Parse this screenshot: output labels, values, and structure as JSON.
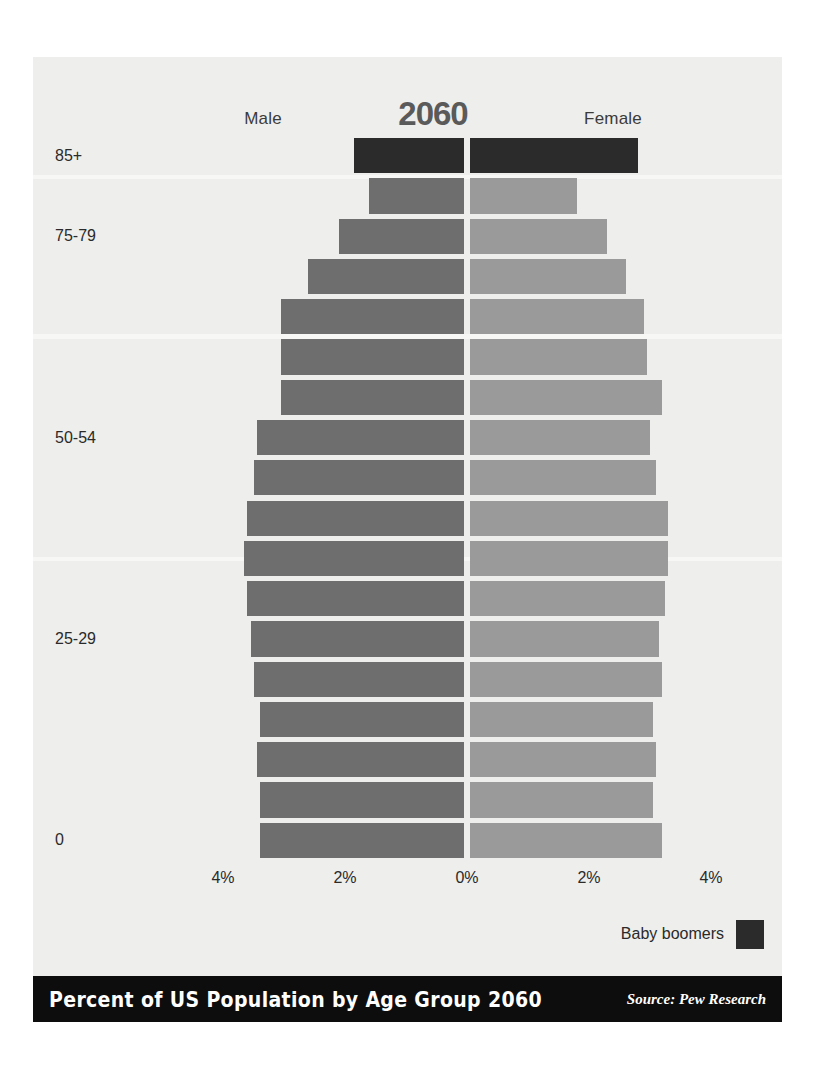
{
  "poster": {
    "background_color": "#eeeeec",
    "footer_bg_color": "#0d0d0d",
    "footer_text_color": "#ffffff"
  },
  "header": {
    "year": "2060",
    "male_label": "Male",
    "female_label": "Female"
  },
  "legend": {
    "label": "Baby boomers",
    "color": "#2b2b2b"
  },
  "footer": {
    "title": "Percent of US Population by Age Group 2060",
    "source": "Source: Pew Research"
  },
  "chart_data": {
    "type": "bar",
    "subtype": "population-pyramid",
    "title": "Percent of US Population by Age Group 2060",
    "year": "2060",
    "xlabel": "",
    "ylabel": "",
    "xlim": [
      -4,
      4
    ],
    "xticks": [
      -4,
      -2,
      0,
      2,
      4
    ],
    "xtick_labels": [
      "4%",
      "2%",
      "0%",
      "2%",
      "4%"
    ],
    "grid": false,
    "legend_position": "bottom-right",
    "center_pixel": 434,
    "pixels_per_percent": 61,
    "colors": {
      "male": "#6e6e6e",
      "female": "#9a9a9a",
      "baby_boomer": "#2b2b2b"
    },
    "categories": [
      "85+",
      "80-84",
      "75-79",
      "70-74",
      "65-69",
      "60-64",
      "55-59",
      "50-54",
      "45-49",
      "40-44",
      "35-39",
      "30-34",
      "25-29",
      "20-24",
      "15-19",
      "10-14",
      "5-9",
      "0"
    ],
    "visible_tick_labels": [
      "85+",
      "75-79",
      "50-54",
      "25-29",
      "0"
    ],
    "visible_tick_indices": [
      0,
      2,
      7,
      12,
      17
    ],
    "series": [
      {
        "name": "Male",
        "color": "#6e6e6e",
        "side": "left",
        "values": [
          1.8,
          1.55,
          2.05,
          2.55,
          3.0,
          3.0,
          3.0,
          3.4,
          3.45,
          3.55,
          3.6,
          3.55,
          3.5,
          3.45,
          3.35,
          3.4,
          3.35,
          3.35
        ]
      },
      {
        "name": "Female",
        "color": "#9a9a9a",
        "side": "right",
        "values": [
          2.75,
          1.75,
          2.25,
          2.55,
          2.85,
          2.9,
          3.15,
          2.95,
          3.05,
          3.25,
          3.25,
          3.2,
          3.1,
          3.15,
          3.0,
          3.05,
          3.0,
          3.15
        ]
      }
    ],
    "baby_boomer_rows": [
      0
    ],
    "annotations": [
      "Male",
      "Female",
      "2060",
      "Baby boomers"
    ]
  }
}
